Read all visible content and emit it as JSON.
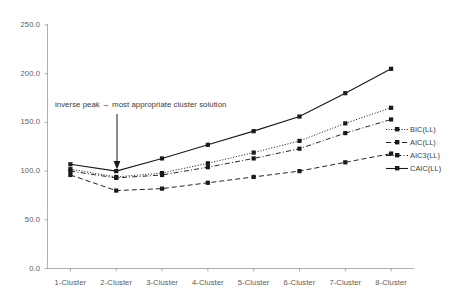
{
  "chart_data": {
    "type": "line",
    "title": "",
    "xlabel": "",
    "ylabel": "",
    "ylim": [
      0,
      250
    ],
    "ytick_step": 50,
    "grid": false,
    "legend_position": "right",
    "categories": [
      "1-Cluster",
      "2-Cluster",
      "3-Cluster",
      "4-Cluster",
      "5-Cluster",
      "6-Cluster",
      "7-Cluster",
      "8-Cluster"
    ],
    "ytick_labels": [
      "0.0",
      "50.0",
      "100.0",
      "150.0",
      "200.0",
      "250.0"
    ],
    "ytick_values": [
      0,
      50,
      100,
      150,
      200,
      250
    ],
    "series": [
      {
        "name": "BIC(LL)",
        "style": "dotted",
        "color": "#1a1a1a",
        "marker": "square",
        "values": [
          102,
          94,
          98,
          108,
          119,
          131,
          149,
          165
        ]
      },
      {
        "name": "AIC(LL)",
        "style": "dashed",
        "color": "#1a1a1a",
        "marker": "square",
        "values": [
          96,
          80,
          82,
          88,
          94,
          100,
          109,
          118
        ]
      },
      {
        "name": "AIC3(LL)",
        "style": "dashdot",
        "color": "#1a1a1a",
        "marker": "square",
        "values": [
          100,
          93,
          96,
          104,
          113,
          123,
          139,
          153
        ]
      },
      {
        "name": "CAIC(LL)",
        "style": "solid",
        "color": "#1a1a1a",
        "marker": "square",
        "values": [
          107,
          100,
          113,
          127,
          141,
          156,
          180,
          205
        ]
      }
    ],
    "annotations": [
      {
        "text": "inverse peak → most appropriate cluster solution",
        "points_to_category": "2-Cluster",
        "arrow": "down"
      }
    ]
  },
  "legend": {
    "entries": [
      {
        "label": "BIC(LL)"
      },
      {
        "label": "AIC(LL)"
      },
      {
        "label": "AIC3(LL)"
      },
      {
        "label": "CAIC(LL)"
      }
    ]
  }
}
